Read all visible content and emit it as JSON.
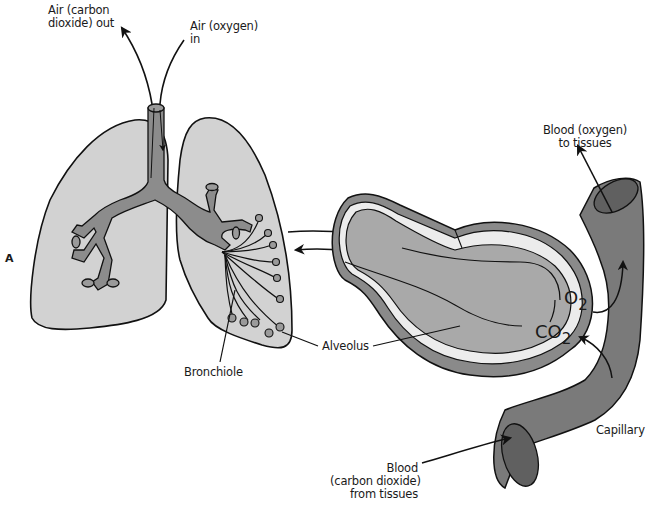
{
  "figure": {
    "panel_label": "A",
    "colors": {
      "lung_fill": "#d2d2d2",
      "airway_fill": "#8c8c8c",
      "alveolus_inner": "#a9a9a9",
      "alveolus_outer": "#8a8a8a",
      "membrane": "#ececec",
      "capillary": "#7a7a7a",
      "capillary_end": "#606060",
      "outline": "#111111"
    }
  },
  "labels": {
    "air_out": "Air (carbon\ndioxide) out",
    "air_in": "Air (oxygen)\nin",
    "blood_to_tissues": "Blood (oxygen)\nto tissues",
    "bronchiole": "Bronchiole",
    "alveolus": "Alveolus",
    "capillary": "Capillary",
    "blood_from_tissues": "Blood\n(carbon dioxide)\nfrom tissues",
    "o2": "O",
    "o2_sub": "2",
    "co2": "CO",
    "co2_sub": "2"
  }
}
